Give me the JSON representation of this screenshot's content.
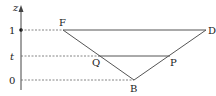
{
  "diagram": {
    "axis": {
      "label": "z",
      "ticks": [
        {
          "label": "1",
          "y": 30
        },
        {
          "label": "t",
          "y": 56
        },
        {
          "label": "0",
          "y": 80
        }
      ]
    },
    "points": {
      "F": {
        "label": "F",
        "x": 63,
        "y": 30
      },
      "D": {
        "label": "D",
        "x": 206,
        "y": 30
      },
      "B": {
        "label": "B",
        "x": 134,
        "y": 80
      },
      "Q": {
        "label": "Q",
        "x": 98,
        "y": 56
      },
      "P": {
        "label": "P",
        "x": 170,
        "y": 56
      }
    },
    "colors": {
      "line": "#555555",
      "dash": "#666666",
      "text": "#222222"
    }
  }
}
